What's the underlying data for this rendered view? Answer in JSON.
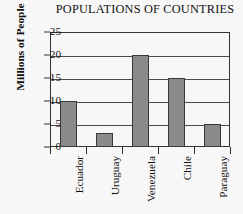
{
  "chart_data": {
    "type": "bar",
    "title": "POPULATIONS OF COUNTRIES",
    "xlabel": "",
    "ylabel": "Millions of People",
    "categories": [
      "Ecuador",
      "Uruguay",
      "Venezuela",
      "Chile",
      "Paraguay"
    ],
    "values": [
      10,
      3,
      20,
      15,
      5
    ],
    "ylim": [
      0,
      25
    ],
    "ytick_labels": [
      "0",
      "5",
      "10",
      "15",
      "20",
      "25"
    ],
    "ytick_values": [
      0,
      5,
      10,
      15,
      20,
      25
    ],
    "grid": "horizontal",
    "legend": "none",
    "series": [
      {
        "name": "Population",
        "values": [
          10,
          3,
          20,
          15,
          5
        ]
      }
    ]
  },
  "style": {
    "bar_fill": "#8a8a8a",
    "bar_stroke": "#3a3a3a",
    "axis_color": "#333333",
    "grid_color": "#4a4a4a",
    "background": "#f7f7f7",
    "text_color": "#111111"
  }
}
